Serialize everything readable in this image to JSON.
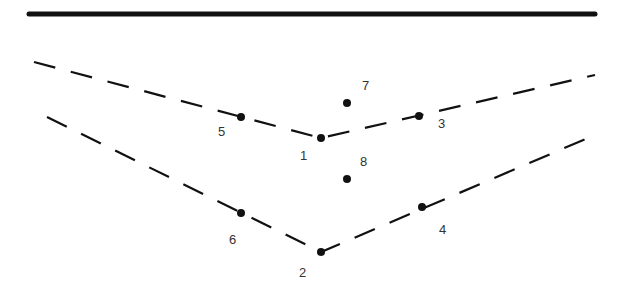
{
  "diagram": {
    "colors": {
      "ink": "#111111",
      "label": "#333333",
      "background": "#ffffff"
    },
    "surface_line": {
      "x1": 29,
      "y1": 14,
      "x2": 595,
      "y2": 14
    },
    "upper_reflector": {
      "style": "dashed",
      "points": [
        [
          34,
          62
        ],
        [
          321,
          138
        ],
        [
          595,
          75
        ]
      ]
    },
    "lower_reflector": {
      "style": "dashed",
      "points": [
        [
          47,
          117
        ],
        [
          321,
          252
        ],
        [
          595,
          135
        ]
      ]
    },
    "points": [
      {
        "id": "1",
        "x": 321,
        "y": 138,
        "label": "1",
        "lx": 300,
        "ly": 160
      },
      {
        "id": "2",
        "x": 321,
        "y": 252,
        "label": "2",
        "lx": 299,
        "ly": 277
      },
      {
        "id": "3",
        "x": 419,
        "y": 116,
        "label": "3",
        "lx": 438,
        "ly": 128
      },
      {
        "id": "4",
        "x": 422,
        "y": 207,
        "label": "4",
        "lx": 439,
        "ly": 234
      },
      {
        "id": "5",
        "x": 241,
        "y": 117,
        "label": "5",
        "lx": 218,
        "ly": 136
      },
      {
        "id": "6",
        "x": 241,
        "y": 213,
        "label": "6",
        "lx": 229,
        "ly": 244
      },
      {
        "id": "7",
        "x": 347,
        "y": 103,
        "label": "7",
        "lx": 362,
        "ly": 90
      },
      {
        "id": "8",
        "x": 347,
        "y": 179,
        "label": "8",
        "lx": 360,
        "ly": 166
      }
    ]
  }
}
